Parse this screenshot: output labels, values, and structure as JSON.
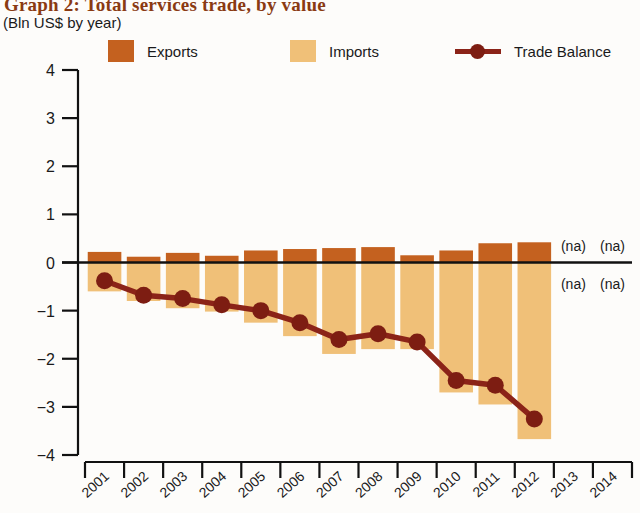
{
  "title": "Graph 2: Total services trade, by value",
  "subtitle": "(Bln US$ by year)",
  "colors": {
    "exports": "#C4611F",
    "imports": "#F0C078",
    "balance": "#8B2318",
    "marker": "#7d1d12",
    "axis": "#111111",
    "text": "#1a1a1a",
    "title": "#8a3a12"
  },
  "legend": {
    "position": "top",
    "items": [
      {
        "label": "Exports",
        "type": "swatch",
        "color": "#C4611F"
      },
      {
        "label": "Imports",
        "type": "swatch",
        "color": "#F0C078"
      },
      {
        "label": "Trade Balance",
        "type": "line-marker",
        "color": "#8B2318"
      }
    ]
  },
  "annotations": [
    {
      "text": "(na)",
      "year": "2013",
      "side": "above-zero"
    },
    {
      "text": "(na)",
      "year": "2014",
      "side": "above-zero"
    },
    {
      "text": "(na)",
      "year": "2013",
      "side": "below-zero"
    },
    {
      "text": "(na)",
      "year": "2014",
      "side": "below-zero"
    }
  ],
  "chart_data": {
    "type": "bar",
    "title": "Graph 2: Total services trade, by value",
    "subtitle": "(Bln US$ by year)",
    "xlabel": "",
    "ylabel": "",
    "ylim": [
      -4,
      4
    ],
    "yticks": [
      4,
      3,
      2,
      1,
      0,
      -1,
      -2,
      -3,
      -4
    ],
    "ytick_labels": [
      "4",
      "3",
      "2",
      "1",
      "0",
      "−1",
      "−2",
      "−3",
      "−4"
    ],
    "grid": false,
    "legend_position": "top",
    "categories": [
      "2001",
      "2002",
      "2003",
      "2004",
      "2005",
      "2006",
      "2007",
      "2008",
      "2009",
      "2010",
      "2011",
      "2012",
      "2013",
      "2014"
    ],
    "series": [
      {
        "name": "Exports",
        "type": "bar",
        "color": "#C4611F",
        "values": [
          0.22,
          0.12,
          0.2,
          0.14,
          0.25,
          0.28,
          0.3,
          0.32,
          0.15,
          0.25,
          0.4,
          0.42,
          null,
          null
        ]
      },
      {
        "name": "Imports",
        "type": "bar",
        "color": "#F0C078",
        "note": "plotted downward from zero as negative magnitude",
        "values": [
          -0.6,
          -0.8,
          -0.95,
          -1.02,
          -1.25,
          -1.53,
          -1.9,
          -1.8,
          -1.8,
          -2.7,
          -2.95,
          -3.67,
          null,
          null
        ]
      },
      {
        "name": "Trade Balance",
        "type": "line",
        "color": "#8B2318",
        "values": [
          -0.38,
          -0.68,
          -0.75,
          -0.88,
          -1.0,
          -1.25,
          -1.6,
          -1.48,
          -1.65,
          -2.45,
          -2.55,
          -3.25,
          null,
          null
        ]
      }
    ]
  }
}
